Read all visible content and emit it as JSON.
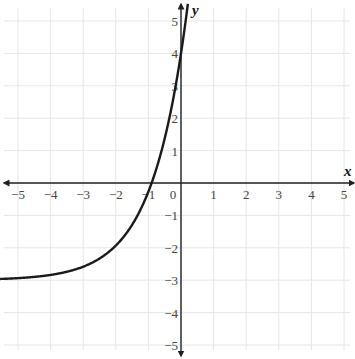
{
  "chart_data": {
    "type": "line",
    "title": "",
    "xlabel": "x",
    "ylabel": "y",
    "xlim": [
      -5.5,
      5.2
    ],
    "ylim": [
      -5.5,
      5.5
    ],
    "grid": true,
    "x_ticks": [
      -5,
      -4,
      -3,
      -2,
      -1,
      0,
      1,
      2,
      3,
      4,
      5
    ],
    "y_ticks": [
      -5,
      -4,
      -3,
      -2,
      -1,
      1,
      2,
      3,
      4,
      5
    ],
    "x_tick_labels": [
      "−5",
      "−4",
      "−3",
      "−2",
      "−1",
      "0",
      "1",
      "2",
      "3",
      "4",
      "5"
    ],
    "y_tick_labels": [
      "−5",
      "−4",
      "−3",
      "−2",
      "−1",
      "1",
      "2",
      "3",
      "4",
      "5"
    ],
    "series": [
      {
        "name": "exponential curve",
        "description": "Exponential growth curve with horizontal asymptote y = -3, y-intercept (0, 4), x-intercept near x = -0.9",
        "equation_approx": "y = 7*e^(0.94x) - 3",
        "asymptote_y": -3,
        "points": [
          {
            "x": -5.5,
            "y": -2.96
          },
          {
            "x": -5,
            "y": -2.94
          },
          {
            "x": -4,
            "y": -2.84
          },
          {
            "x": -3,
            "y": -2.58
          },
          {
            "x": -2,
            "y": -1.93
          },
          {
            "x": -1,
            "y": -0.27
          },
          {
            "x": -0.9,
            "y": 0.0
          },
          {
            "x": -0.5,
            "y": 1.38
          },
          {
            "x": 0,
            "y": 4.0
          },
          {
            "x": 0.2,
            "y": 5.45
          }
        ]
      }
    ]
  },
  "labels": {
    "x_axis": "x",
    "y_axis": "y"
  }
}
